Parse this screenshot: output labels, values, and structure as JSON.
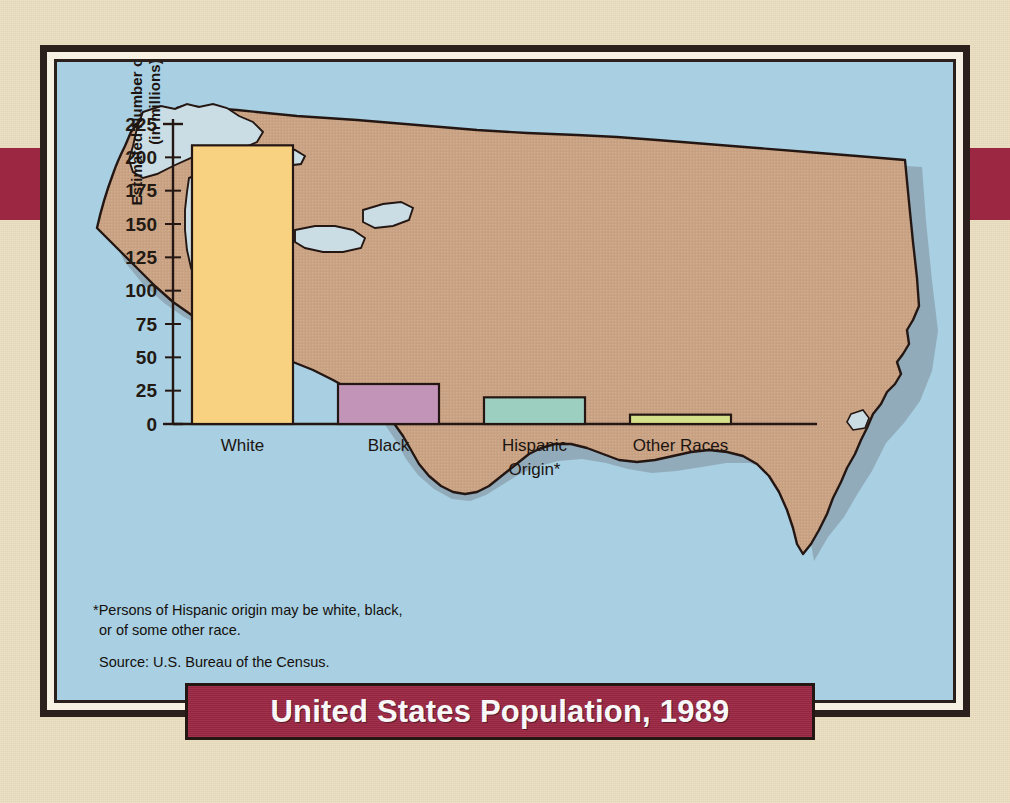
{
  "title": "United States Population, 1989",
  "footnotes": {
    "hispanic_line1": "*Persons of Hispanic origin may be white, black,",
    "hispanic_line2": "or of some other race.",
    "source": "Source: U.S. Bureau of the Census."
  },
  "axis": {
    "y_title_line1": "Estimated Number of People",
    "y_title_line2": "(in millions)"
  },
  "colors": {
    "banner": "#9B2743",
    "accent_stripe": "#9B2743",
    "paper": "#E9DCBC",
    "frame_dark": "#2C201C",
    "frame_cream": "#F6F1E2",
    "water": "#A8CFE2",
    "land": "#C9A384",
    "coast_shadow": "#8B9AA3",
    "bar_white": "#F8D181",
    "bar_black": "#C294B8",
    "bar_hispanic": "#9CCFC0",
    "bar_other": "#D5E08A",
    "outline": "#241713"
  },
  "chart_data": {
    "type": "bar",
    "title": "United States Population, 1989",
    "xlabel": "",
    "ylabel": "Estimated Number of People (in millions)",
    "ylim": [
      0,
      225
    ],
    "yticks": [
      0,
      25,
      50,
      75,
      100,
      125,
      150,
      175,
      200,
      225
    ],
    "ytick_labels": [
      "0",
      "25",
      "50",
      "75",
      "100",
      "125",
      "150",
      "175",
      "200",
      "225"
    ],
    "grid": false,
    "legend": false,
    "categories": [
      "White",
      "Black",
      "Hispanic Origin*",
      "Other Races"
    ],
    "category_labels": [
      [
        "White"
      ],
      [
        "Black"
      ],
      [
        "Hispanic",
        "Origin*"
      ],
      [
        "Other Races"
      ]
    ],
    "values": [
      209,
      30,
      20,
      7
    ],
    "bar_colors": [
      "#F8D181",
      "#C294B8",
      "#9CCFC0",
      "#D5E08A"
    ],
    "units": "millions of people",
    "source": "U.S. Bureau of the Census",
    "note": "*Persons of Hispanic origin may be white, black, or of some other race."
  }
}
